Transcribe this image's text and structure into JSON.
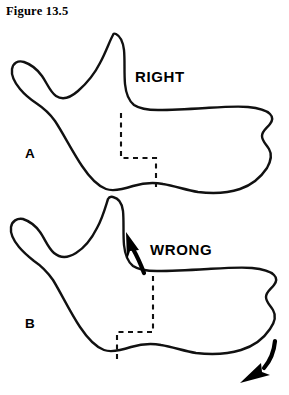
{
  "figure": {
    "caption": "Figure 13.5",
    "background_color": "#ffffff",
    "ink_color": "#111111"
  },
  "labels": {
    "right": "RIGHT",
    "wrong": "WRONG",
    "panel_a": "A",
    "panel_b": "B"
  },
  "panels": [
    {
      "id": "A",
      "label": "A",
      "annotation": "RIGHT",
      "description": "mandible-outline-correct-alignment"
    },
    {
      "id": "B",
      "label": "B",
      "annotation": "WRONG",
      "description": "mandible-outline-incorrect-alignment"
    }
  ],
  "icons": {
    "arrow_up": "curved-arrow-up-icon",
    "arrow_down": "curved-arrow-down-icon",
    "step_guide": "dashed-step-line-icon"
  }
}
